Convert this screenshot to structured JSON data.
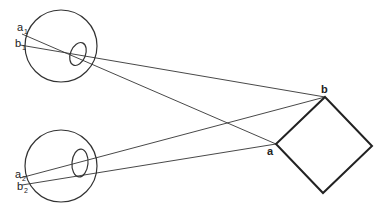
{
  "diagram": {
    "colors": {
      "stroke": "#333333",
      "square": "#222222",
      "background": "#ffffff"
    },
    "eyes": [
      {
        "id": "top-eye",
        "labels": {
          "a": "a",
          "a_sub": "1",
          "b": "b",
          "b_sub": "1"
        }
      },
      {
        "id": "bottom-eye",
        "labels": {
          "a": "a",
          "a_sub": "2",
          "b": "b",
          "b_sub": "2"
        }
      }
    ],
    "object": {
      "shape": "square (rotated 45°)",
      "labels": {
        "a": "a",
        "b": "b"
      }
    }
  }
}
